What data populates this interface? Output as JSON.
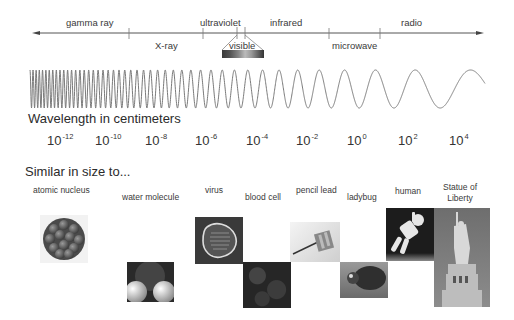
{
  "spectrum": {
    "bands_above": [
      {
        "label": "gamma ray",
        "x": 66
      },
      {
        "label": "ultraviolet",
        "x": 200
      },
      {
        "label": "infrared",
        "x": 270
      },
      {
        "label": "radio",
        "x": 401
      }
    ],
    "bands_below": [
      {
        "label": "X-ray",
        "x": 155
      },
      {
        "label": "visible",
        "x": 229
      },
      {
        "label": "microwave",
        "x": 332
      }
    ],
    "tick_positions": [
      129,
      203,
      237,
      245,
      329,
      380
    ]
  },
  "wavelength": {
    "title": "Wavelength in centimeters",
    "ticks": [
      {
        "base": "10",
        "exp": "-12"
      },
      {
        "base": "10",
        "exp": "-10"
      },
      {
        "base": "10",
        "exp": "-8"
      },
      {
        "base": "10",
        "exp": "-6"
      },
      {
        "base": "10",
        "exp": "-4"
      },
      {
        "base": "10",
        "exp": "-2"
      },
      {
        "base": "10",
        "exp": "0"
      },
      {
        "base": "10",
        "exp": "2"
      },
      {
        "base": "10",
        "exp": "4"
      }
    ]
  },
  "comparison": {
    "title": "Similar in size to...",
    "items": [
      {
        "label": "atomic nucleus"
      },
      {
        "label": "water molecule"
      },
      {
        "label": "virus"
      },
      {
        "label": "blood cell"
      },
      {
        "label": "pencil lead"
      },
      {
        "label": "ladybug"
      },
      {
        "label": "human"
      },
      {
        "label_line1": "Statue of",
        "label_line2": "Liberty"
      }
    ]
  },
  "colors": {
    "line": "#555555",
    "wave": "#7a7a7a",
    "text": "#333333"
  }
}
